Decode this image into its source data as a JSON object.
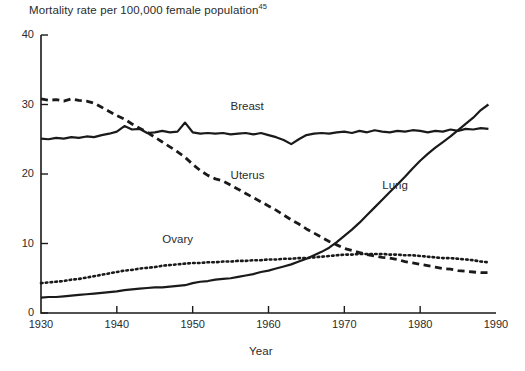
{
  "chart_data": {
    "type": "line",
    "title": "Mortality rate per 100,000 female population",
    "title_superscript": "45",
    "xlabel": "Year",
    "ylabel": "",
    "xlim": [
      1930,
      1990
    ],
    "ylim": [
      0,
      40
    ],
    "xticks": [
      1930,
      1940,
      1950,
      1960,
      1970,
      1980,
      1990
    ],
    "yticks": [
      0,
      10,
      20,
      30,
      40
    ],
    "grid": false,
    "legend_position": "inline-labels",
    "x": [
      1930,
      1931,
      1932,
      1933,
      1934,
      1935,
      1936,
      1937,
      1938,
      1939,
      1940,
      1941,
      1942,
      1943,
      1944,
      1945,
      1946,
      1947,
      1948,
      1949,
      1950,
      1951,
      1952,
      1953,
      1954,
      1955,
      1956,
      1957,
      1958,
      1959,
      1960,
      1961,
      1962,
      1963,
      1964,
      1965,
      1966,
      1967,
      1968,
      1969,
      1970,
      1971,
      1972,
      1973,
      1974,
      1975,
      1976,
      1977,
      1978,
      1979,
      1980,
      1981,
      1982,
      1983,
      1984,
      1985,
      1986,
      1987,
      1988,
      1989
    ],
    "series": [
      {
        "name": "Breast",
        "style": "solid",
        "color": "#1a1a1a",
        "label_x": 1955,
        "label_y": 29.5,
        "values": [
          25.1,
          25.0,
          25.2,
          25.1,
          25.3,
          25.2,
          25.4,
          25.3,
          25.6,
          25.8,
          26.1,
          26.9,
          26.4,
          26.5,
          25.9,
          26.0,
          26.2,
          26.0,
          26.1,
          27.4,
          26.0,
          25.8,
          25.9,
          25.8,
          25.9,
          25.7,
          25.8,
          25.9,
          25.7,
          25.9,
          25.6,
          25.3,
          24.9,
          24.3,
          25.0,
          25.6,
          25.8,
          25.9,
          25.8,
          26.0,
          26.1,
          25.9,
          26.2,
          26.0,
          26.3,
          26.1,
          26.0,
          26.2,
          26.1,
          26.3,
          26.2,
          26.0,
          26.2,
          26.1,
          26.4,
          26.2,
          26.5,
          26.4,
          26.6,
          26.5
        ]
      },
      {
        "name": "Uterus",
        "style": "dashed",
        "color": "#1a1a1a",
        "label_x": 1955,
        "label_y": 19.5,
        "values": [
          30.8,
          30.6,
          30.7,
          30.5,
          30.8,
          30.6,
          30.5,
          30.2,
          29.6,
          29.0,
          28.4,
          27.9,
          27.2,
          26.6,
          26.0,
          25.3,
          24.6,
          23.9,
          23.2,
          22.4,
          21.4,
          20.5,
          19.8,
          19.3,
          19.0,
          18.4,
          17.8,
          17.2,
          16.6,
          16.0,
          15.4,
          14.8,
          14.1,
          13.4,
          12.8,
          12.1,
          11.5,
          10.9,
          10.3,
          9.8,
          9.3,
          9.0,
          8.7,
          8.4,
          8.2,
          8.0,
          7.9,
          7.7,
          7.4,
          7.2,
          7.0,
          6.8,
          6.6,
          6.4,
          6.3,
          6.1,
          6.0,
          5.9,
          5.8,
          5.8
        ]
      },
      {
        "name": "Ovary",
        "style": "dotted",
        "color": "#1a1a1a",
        "label_x": 1946,
        "label_y": 10.3,
        "values": [
          4.3,
          4.4,
          4.5,
          4.6,
          4.8,
          4.9,
          5.1,
          5.3,
          5.5,
          5.7,
          5.9,
          6.1,
          6.2,
          6.4,
          6.5,
          6.6,
          6.8,
          6.9,
          7.0,
          7.1,
          7.2,
          7.2,
          7.3,
          7.3,
          7.4,
          7.4,
          7.5,
          7.5,
          7.6,
          7.6,
          7.7,
          7.7,
          7.8,
          7.8,
          7.9,
          7.9,
          8.0,
          8.1,
          8.2,
          8.3,
          8.4,
          8.4,
          8.5,
          8.5,
          8.5,
          8.5,
          8.4,
          8.4,
          8.3,
          8.3,
          8.2,
          8.1,
          8.0,
          7.9,
          7.9,
          7.8,
          7.7,
          7.6,
          7.4,
          7.3
        ]
      },
      {
        "name": "Lung",
        "style": "solid",
        "color": "#1a1a1a",
        "label_x": 1975,
        "label_y": 18.2,
        "values": [
          2.2,
          2.3,
          2.3,
          2.4,
          2.5,
          2.6,
          2.7,
          2.8,
          2.9,
          3.0,
          3.1,
          3.3,
          3.4,
          3.5,
          3.6,
          3.7,
          3.7,
          3.8,
          3.9,
          4.0,
          4.3,
          4.5,
          4.6,
          4.8,
          4.9,
          5.0,
          5.2,
          5.4,
          5.6,
          5.9,
          6.1,
          6.4,
          6.7,
          7.0,
          7.4,
          7.8,
          8.3,
          8.8,
          9.4,
          10.2,
          11.1,
          12.0,
          13.0,
          14.1,
          15.2,
          16.3,
          17.4,
          18.5,
          19.6,
          20.8,
          21.9,
          22.9,
          23.8,
          24.6,
          25.4,
          26.3,
          27.2,
          28.1,
          29.2,
          30.0
        ]
      }
    ]
  }
}
